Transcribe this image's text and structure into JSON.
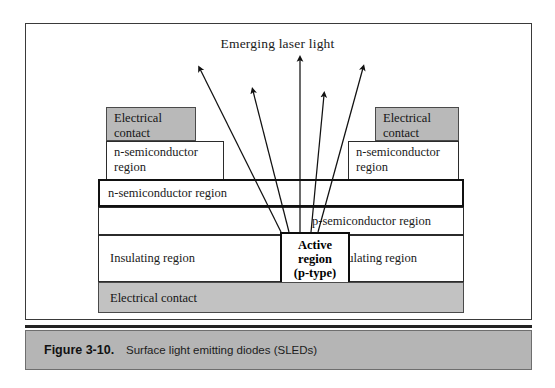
{
  "figure": {
    "title": "Emerging laser light",
    "caption_number": "Figure 3-10.",
    "caption_text": "Surface light emitting diodes (SLEDs)",
    "colors": {
      "contact_gray": "#b9b9b9",
      "caption_gray": "#b5b5b5",
      "line_black": "#111111",
      "page_white": "#ffffff"
    }
  },
  "layers": {
    "contact_left": "Electrical\ncontact",
    "contact_right": "Electrical\ncontact",
    "shoulder_left": "n-semiconductor\nregion",
    "shoulder_right": "n-semiconductor\nregion",
    "n_band": "n-semiconductor region",
    "p_band": "p-semiconductor region",
    "insulating_left": "Insulating region",
    "insulating_right": "Insulating region",
    "active_region": "Active\nregion\n(p-type)",
    "bottom_contact": "Electrical contact"
  },
  "rays": {
    "count": 5,
    "label": "emerging-light-rays",
    "paths": [
      {
        "x1": 281,
        "y1": 232,
        "x2": 200,
        "y2": 69
      },
      {
        "x1": 289,
        "y1": 232,
        "x2": 253,
        "y2": 91
      },
      {
        "x1": 300,
        "y1": 232,
        "x2": 300,
        "y2": 59
      },
      {
        "x1": 311,
        "y1": 232,
        "x2": 324,
        "y2": 95
      },
      {
        "x1": 318,
        "y1": 232,
        "x2": 363,
        "y2": 68
      }
    ]
  }
}
